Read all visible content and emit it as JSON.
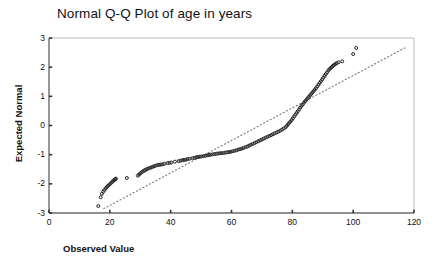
{
  "chart_data": {
    "type": "scatter",
    "title": "Normal Q-Q Plot of age in years",
    "xlabel": "Observed Value",
    "ylabel": "Expected Normal",
    "xlim": [
      0,
      120
    ],
    "ylim": [
      -3,
      3
    ],
    "xticks": [
      0,
      20,
      40,
      60,
      80,
      100,
      120
    ],
    "yticks": [
      -3,
      -2,
      -1,
      0,
      1,
      2,
      3
    ],
    "grid": false,
    "legend": "none",
    "marker": "open-circle",
    "marker_color": "#222222",
    "reference_line": {
      "style": "dotted",
      "color": "#777777",
      "x0": 18.0,
      "y0": -2.85,
      "x1": 117.0,
      "y1": 2.66
    },
    "series": [
      {
        "name": "age in years",
        "points": [
          [
            16.2,
            -2.76
          ],
          [
            17.0,
            -2.46
          ],
          [
            17.4,
            -2.34
          ],
          [
            17.8,
            -2.27
          ],
          [
            18.2,
            -2.21
          ],
          [
            18.6,
            -2.16
          ],
          [
            19.0,
            -2.11
          ],
          [
            19.4,
            -2.07
          ],
          [
            19.8,
            -2.03
          ],
          [
            20.2,
            -1.99
          ],
          [
            20.6,
            -1.95
          ],
          [
            20.9,
            -1.92
          ],
          [
            21.2,
            -1.89
          ],
          [
            21.5,
            -1.86
          ],
          [
            21.8,
            -1.84
          ],
          [
            22.0,
            -1.82
          ],
          [
            25.6,
            -1.8
          ],
          [
            29.2,
            -1.72
          ],
          [
            29.6,
            -1.68
          ],
          [
            30.0,
            -1.64
          ],
          [
            30.4,
            -1.61
          ],
          [
            30.8,
            -1.58
          ],
          [
            31.2,
            -1.55
          ],
          [
            31.6,
            -1.53
          ],
          [
            32.0,
            -1.5
          ],
          [
            32.5,
            -1.48
          ],
          [
            33.0,
            -1.46
          ],
          [
            33.5,
            -1.44
          ],
          [
            34.0,
            -1.42
          ],
          [
            34.5,
            -1.4
          ],
          [
            35.0,
            -1.38
          ],
          [
            35.6,
            -1.36
          ],
          [
            36.2,
            -1.35
          ],
          [
            36.8,
            -1.34
          ],
          [
            37.4,
            -1.33
          ],
          [
            38.0,
            -1.31
          ],
          [
            39.0,
            -1.29
          ],
          [
            39.6,
            -1.28
          ],
          [
            40.2,
            -1.27
          ],
          [
            41.4,
            -1.24
          ],
          [
            42.6,
            -1.22
          ],
          [
            43.2,
            -1.21
          ],
          [
            43.8,
            -1.19
          ],
          [
            44.4,
            -1.18
          ],
          [
            45.0,
            -1.17
          ],
          [
            45.6,
            -1.15
          ],
          [
            46.2,
            -1.14
          ],
          [
            47.2,
            -1.12
          ],
          [
            47.8,
            -1.11
          ],
          [
            48.4,
            -1.09
          ],
          [
            49.0,
            -1.08
          ],
          [
            49.6,
            -1.07
          ],
          [
            50.2,
            -1.06
          ],
          [
            50.8,
            -1.05
          ],
          [
            51.4,
            -1.04
          ],
          [
            52.0,
            -1.02
          ],
          [
            52.6,
            -1.01
          ],
          [
            53.2,
            -1.0
          ],
          [
            53.8,
            -0.99
          ],
          [
            54.4,
            -0.98
          ],
          [
            55.0,
            -0.97
          ],
          [
            55.6,
            -0.96
          ],
          [
            56.2,
            -0.95
          ],
          [
            56.8,
            -0.95
          ],
          [
            57.4,
            -0.94
          ],
          [
            58.0,
            -0.93
          ],
          [
            58.6,
            -0.92
          ],
          [
            59.2,
            -0.91
          ],
          [
            59.8,
            -0.9
          ],
          [
            60.4,
            -0.88
          ],
          [
            61.0,
            -0.87
          ],
          [
            61.6,
            -0.85
          ],
          [
            62.2,
            -0.83
          ],
          [
            62.8,
            -0.81
          ],
          [
            63.4,
            -0.79
          ],
          [
            64.0,
            -0.77
          ],
          [
            64.6,
            -0.74
          ],
          [
            65.2,
            -0.72
          ],
          [
            65.8,
            -0.69
          ],
          [
            66.4,
            -0.66
          ],
          [
            67.0,
            -0.63
          ],
          [
            67.6,
            -0.6
          ],
          [
            68.2,
            -0.57
          ],
          [
            68.8,
            -0.54
          ],
          [
            69.4,
            -0.51
          ],
          [
            70.0,
            -0.48
          ],
          [
            70.6,
            -0.45
          ],
          [
            71.2,
            -0.42
          ],
          [
            71.8,
            -0.39
          ],
          [
            72.4,
            -0.36
          ],
          [
            73.0,
            -0.33
          ],
          [
            73.6,
            -0.3
          ],
          [
            74.2,
            -0.27
          ],
          [
            74.8,
            -0.24
          ],
          [
            75.4,
            -0.21
          ],
          [
            76.0,
            -0.18
          ],
          [
            76.6,
            -0.14
          ],
          [
            77.2,
            -0.1
          ],
          [
            77.8,
            -0.06
          ],
          [
            78.2,
            -0.01
          ],
          [
            78.6,
            0.04
          ],
          [
            79.0,
            0.09
          ],
          [
            79.4,
            0.14
          ],
          [
            79.8,
            0.19
          ],
          [
            80.2,
            0.25
          ],
          [
            80.6,
            0.31
          ],
          [
            81.0,
            0.37
          ],
          [
            81.4,
            0.43
          ],
          [
            81.8,
            0.49
          ],
          [
            82.2,
            0.55
          ],
          [
            82.6,
            0.61
          ],
          [
            83.0,
            0.67
          ],
          [
            83.4,
            0.72
          ],
          [
            83.8,
            0.78
          ],
          [
            84.2,
            0.83
          ],
          [
            84.6,
            0.88
          ],
          [
            85.0,
            0.93
          ],
          [
            85.4,
            0.98
          ],
          [
            85.8,
            1.03
          ],
          [
            86.2,
            1.08
          ],
          [
            86.6,
            1.13
          ],
          [
            87.0,
            1.18
          ],
          [
            87.4,
            1.23
          ],
          [
            87.8,
            1.28
          ],
          [
            88.2,
            1.34
          ],
          [
            88.6,
            1.4
          ],
          [
            89.0,
            1.46
          ],
          [
            89.4,
            1.52
          ],
          [
            89.8,
            1.58
          ],
          [
            90.2,
            1.64
          ],
          [
            90.6,
            1.7
          ],
          [
            91.0,
            1.76
          ],
          [
            91.4,
            1.82
          ],
          [
            91.8,
            1.88
          ],
          [
            92.2,
            1.93
          ],
          [
            92.6,
            1.97
          ],
          [
            93.0,
            2.01
          ],
          [
            93.4,
            2.05
          ],
          [
            93.8,
            2.08
          ],
          [
            94.2,
            2.11
          ],
          [
            94.6,
            2.14
          ],
          [
            95.2,
            2.17
          ],
          [
            96.4,
            2.2
          ],
          [
            100.0,
            2.45
          ],
          [
            101.0,
            2.66
          ]
        ]
      }
    ]
  }
}
